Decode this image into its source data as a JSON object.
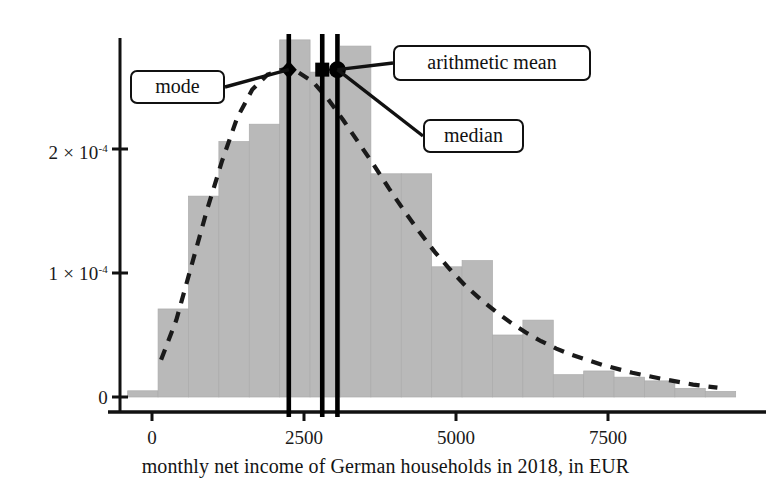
{
  "chart_data": {
    "type": "bar",
    "title": "",
    "subtitle": "",
    "xlabel": "monthly net income of German households in 2018, in EUR",
    "ylabel": "",
    "xlim": [
      -400,
      9500
    ],
    "ylim": [
      0,
      0.000295
    ],
    "grid": false,
    "legend_position": "none",
    "bin_width": 500,
    "xticks": [
      0,
      2500,
      5000,
      7500
    ],
    "xtick_labels": [
      "0",
      "2500",
      "5000",
      "7500"
    ],
    "yticks": [
      0,
      0.0001,
      0.0002
    ],
    "ytick_labels": [
      "0",
      "1 × 10⁻⁴",
      "2 × 10⁻⁴"
    ],
    "ytick_mantissas": [
      "0",
      "1",
      "2"
    ],
    "ytick_exponents": [
      "",
      "-4",
      "-4"
    ],
    "bar_color": "#b9b9b9",
    "curve_color": "#1a1a1a",
    "marker_line_color": "#000000",
    "categories": [
      "-400",
      "100",
      "600",
      "1100",
      "1600",
      "2100",
      "2600",
      "3100",
      "3600",
      "4100",
      "4600",
      "5100",
      "5600",
      "6100",
      "6600",
      "7100",
      "7600",
      "8100",
      "8600",
      "9100"
    ],
    "bin_starts": [
      -400,
      100,
      600,
      1100,
      1600,
      2100,
      2600,
      3100,
      3600,
      4100,
      4600,
      5100,
      5600,
      6100,
      6600,
      7100,
      7600,
      8100,
      8600,
      9100
    ],
    "values": [
      5e-06,
      7.1e-05,
      0.000162,
      0.000206,
      0.00022,
      0.000288,
      0.000262,
      0.000283,
      0.00018,
      0.00018,
      0.000105,
      0.00011,
      5e-05,
      6.2e-05,
      1.8e-05,
      2.1e-05,
      1.6e-05,
      1.3e-05,
      7e-06,
      4.5e-06
    ],
    "density_curve": {
      "label": "fitted log-normal density",
      "style": "dashed",
      "x": [
        150,
        400,
        650,
        900,
        1150,
        1400,
        1650,
        1900,
        2150,
        2250,
        2400,
        2650,
        2900,
        3150,
        3400,
        3650,
        3900,
        4150,
        4400,
        4650,
        4900,
        5150,
        5400,
        5650,
        5900,
        6150,
        6400,
        6650,
        6900,
        7400,
        7900,
        8400,
        8900,
        9300
      ],
      "y": [
        3e-05,
        6.2e-05,
        0.000106,
        0.00015,
        0.00019,
        0.000225,
        0.000248,
        0.00026,
        0.000264,
        0.000264,
        0.000262,
        0.000254,
        0.00024,
        0.000223,
        0.000205,
        0.000187,
        0.000168,
        0.00015,
        0.000133,
        0.000117,
        0.000103,
        9e-05,
        7.9e-05,
        6.9e-05,
        6e-05,
        5.2e-05,
        4.5e-05,
        3.9e-05,
        3.4e-05,
        2.6e-05,
        1.95e-05,
        1.45e-05,
        1e-05,
        7.5e-06
      ]
    },
    "annotations": [
      {
        "name": "mode",
        "label": "mode",
        "x_value": 2250,
        "y_value": 0.000264,
        "marker": "diamond",
        "vertical_line": true
      },
      {
        "name": "median",
        "label": "median",
        "x_value": 2800,
        "y_value": 0.000264,
        "marker": "square",
        "vertical_line": true
      },
      {
        "name": "arithmetic-mean",
        "label": "arithmetic mean",
        "x_value": 3050,
        "y_value": 0.000264,
        "marker": "circle",
        "vertical_line": true
      }
    ]
  }
}
